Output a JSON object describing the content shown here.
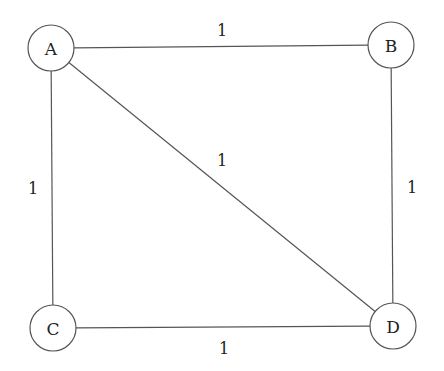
{
  "diagram": {
    "type": "weighted-undirected-graph",
    "style": {
      "stroke": "#555555",
      "node_fill": "#ffffff",
      "text": "#222222",
      "background": "#ffffff"
    },
    "nodes": [
      {
        "id": "A",
        "label": "A",
        "cx": 51,
        "cy": 48,
        "r": 23
      },
      {
        "id": "B",
        "label": "B",
        "cx": 391,
        "cy": 45,
        "r": 23
      },
      {
        "id": "C",
        "label": "C",
        "cx": 53,
        "cy": 328,
        "r": 23
      },
      {
        "id": "D",
        "label": "D",
        "cx": 393,
        "cy": 326,
        "r": 23
      }
    ],
    "edges": [
      {
        "from": "A",
        "to": "B",
        "weight": "1",
        "label_x": 222,
        "label_y": 36
      },
      {
        "from": "A",
        "to": "C",
        "weight": "1",
        "label_x": 33,
        "label_y": 194
      },
      {
        "from": "A",
        "to": "D",
        "weight": "1",
        "label_x": 222,
        "label_y": 166
      },
      {
        "from": "B",
        "to": "D",
        "weight": "1",
        "label_x": 412,
        "label_y": 193
      },
      {
        "from": "C",
        "to": "D",
        "weight": "1",
        "label_x": 224,
        "label_y": 354
      }
    ]
  }
}
